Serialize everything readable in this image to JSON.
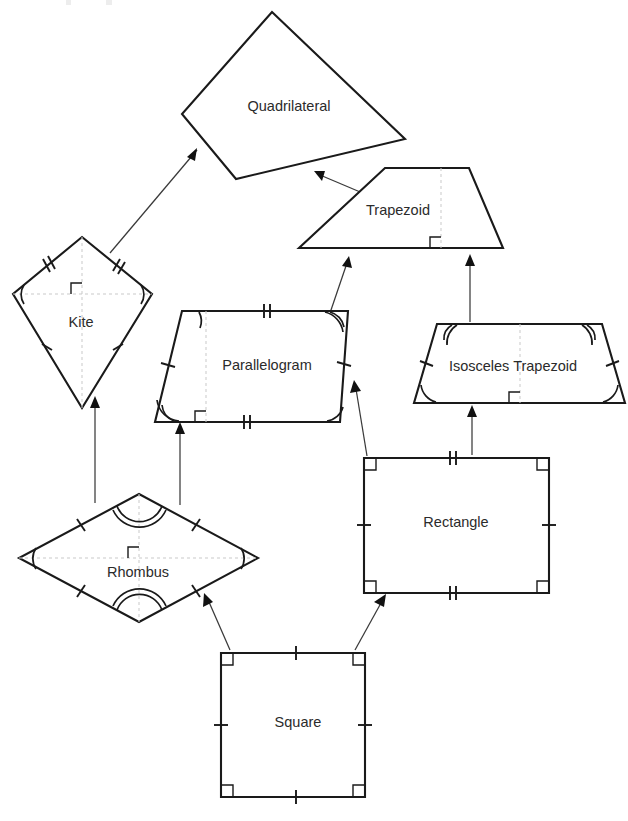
{
  "diagram": {
    "background_color": "#ffffff",
    "stroke_color": "#1a1a1a",
    "text_color": "#2b2b2b",
    "arrow_color": "#3a3a3a",
    "dash_color": "#c9c9c9",
    "cropped_top_text": "",
    "shapes": [
      {
        "id": "quadrilateral",
        "label": "Quadrilateral",
        "label_x": 289,
        "label_y": 107,
        "points": "272,12 405,139 236,179 182,114",
        "marks": {
          "ticks": 0,
          "arcs": 0,
          "right_angles": 0
        }
      },
      {
        "id": "trapezoid",
        "label": "Trapezoid",
        "label_x": 398,
        "label_y": 211,
        "points": "385,168 469,168 503,248 299,248",
        "marks": {
          "ticks": 0,
          "arcs": 0,
          "right_angles": 1
        }
      },
      {
        "id": "kite",
        "label": "Kite",
        "label_x": 81,
        "label_y": 323,
        "points": "82,237 152,294 82,408 13,294",
        "marks": {
          "ticks": 4,
          "arcs": 2,
          "right_angles": 1
        }
      },
      {
        "id": "parallelogram",
        "label": "Parallelogram",
        "label_x": 267,
        "label_y": 366,
        "points": "182,311 348,311 340,422 155,422",
        "marks": {
          "ticks": 4,
          "arcs": 4,
          "right_angles": 1
        }
      },
      {
        "id": "isosceles-trapezoid",
        "label": "Isosceles Trapezoid",
        "label_x": 513,
        "label_y": 367,
        "points": "437,324 602,324 625,403 414,403",
        "marks": {
          "ticks": 2,
          "arcs": 4,
          "right_angles": 1
        }
      },
      {
        "id": "rhombus",
        "label": "Rhombus",
        "label_x": 138,
        "label_y": 573,
        "points": "139,494 258,558 139,622 19,558",
        "marks": {
          "ticks": 4,
          "arcs": 4,
          "right_angles": 1
        }
      },
      {
        "id": "rectangle",
        "label": "Rectangle",
        "label_x": 456,
        "label_y": 523,
        "points": "364,458 549,458 549,593 364,593",
        "marks": {
          "ticks": 4,
          "arcs": 0,
          "right_angles": 4
        }
      },
      {
        "id": "square",
        "label": "Square",
        "label_x": 298,
        "label_y": 723,
        "points": "221,653 365,653 365,797 221,797",
        "marks": {
          "ticks": 4,
          "arcs": 0,
          "right_angles": 4
        }
      }
    ],
    "relations": [
      {
        "id": "kite-to-quadrilateral",
        "from": "kite",
        "to": "quadrilateral",
        "from_point": [
          110,
          253
        ],
        "to_point": [
          197,
          148
        ]
      },
      {
        "id": "trapezoid-to-quadrilateral",
        "from": "trapezoid",
        "to": "quadrilateral",
        "from_point": [
          372,
          196
        ],
        "to_point": [
          317,
          173
        ]
      },
      {
        "id": "parallelogram-to-trapezoid",
        "from": "parallelogram",
        "to": "trapezoid",
        "from_point": [
          330,
          312
        ],
        "to_point": [
          345,
          260
        ]
      },
      {
        "id": "isosceles-trapezoid-to-trapezoid",
        "from": "isosceles-trapezoid",
        "to": "trapezoid",
        "from_point": [
          470,
          322
        ],
        "to_point": [
          470,
          258
        ]
      },
      {
        "id": "rhombus-to-kite",
        "from": "rhombus",
        "to": "kite",
        "from_point": [
          95,
          500
        ],
        "to_point": [
          95,
          400
        ]
      },
      {
        "id": "rhombus-to-parallelogram",
        "from": "rhombus",
        "to": "parallelogram",
        "from_point": [
          180,
          503
        ],
        "to_point": [
          180,
          426
        ]
      },
      {
        "id": "rectangle-to-parallelogram",
        "from": "rectangle",
        "to": "parallelogram",
        "from_point": [
          367,
          455
        ],
        "to_point": [
          354,
          384
        ]
      },
      {
        "id": "rectangle-to-isosceles-trapezoid",
        "from": "rectangle",
        "to": "isosceles-trapezoid",
        "from_point": [
          472,
          455
        ],
        "to_point": [
          472,
          407
        ]
      },
      {
        "id": "square-to-rhombus",
        "from": "square",
        "to": "rhombus",
        "from_point": [
          228,
          649
        ],
        "to_point": [
          205,
          596
        ]
      },
      {
        "id": "square-to-rectangle",
        "from": "square",
        "to": "rectangle",
        "from_point": [
          357,
          649
        ],
        "to_point": [
          385,
          597
        ]
      }
    ]
  }
}
